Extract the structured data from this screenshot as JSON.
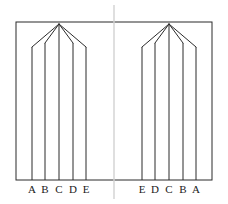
{
  "figure": {
    "background_color": "#ffffff",
    "line_color": "#2b2b2b",
    "axis_color": "#d2d2d2",
    "label_color": "#1a1a1a",
    "frame": {
      "x": 16,
      "y": 22,
      "width": 196,
      "height": 158,
      "stroke_width": 1
    },
    "symmetry_axis": {
      "x": 114,
      "y_top": 5,
      "y_bottom": 199,
      "stroke_width": 1.4,
      "color": "#d2d2d2"
    },
    "baseline_y": 180,
    "apex_y": 24,
    "label_y": 193,
    "groups": [
      {
        "name": "left-group",
        "apex_x": 59,
        "members": [
          {
            "label": "A",
            "x": 32,
            "top_y": 47
          },
          {
            "label": "B",
            "x": 45,
            "top_y": 43
          },
          {
            "label": "C",
            "x": 59,
            "top_y": 24
          },
          {
            "label": "D",
            "x": 73,
            "top_y": 43
          },
          {
            "label": "E",
            "x": 86,
            "top_y": 47
          }
        ]
      },
      {
        "name": "right-group",
        "apex_x": 169,
        "members": [
          {
            "label": "E",
            "x": 142,
            "top_y": 47
          },
          {
            "label": "D",
            "x": 155,
            "top_y": 43
          },
          {
            "label": "C",
            "x": 169,
            "top_y": 24
          },
          {
            "label": "B",
            "x": 183,
            "top_y": 43
          },
          {
            "label": "A",
            "x": 196,
            "top_y": 47
          }
        ]
      }
    ]
  }
}
